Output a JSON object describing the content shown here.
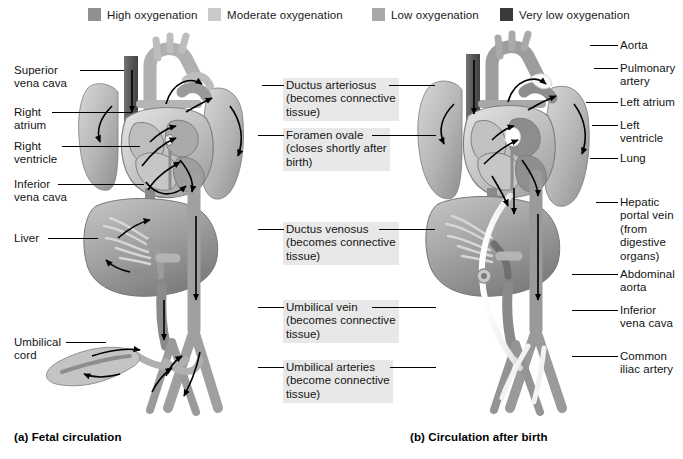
{
  "figure": {
    "width": 683,
    "height": 459
  },
  "legend": {
    "items": [
      {
        "label": "High oxygenation",
        "color": "#8f8f8f",
        "x": 88,
        "y": 0
      },
      {
        "label": "Moderate oxygenation",
        "color": "#c9c9c9",
        "x": 208,
        "y": 0
      },
      {
        "label": "Low oxygenation",
        "color": "#a8a8a8",
        "x": 372,
        "y": 0
      },
      {
        "label": "Very low oxygenation",
        "color": "#3a3a3a",
        "x": 500,
        "y": 0
      }
    ]
  },
  "panels": {
    "left": {
      "caption": "(a) Fetal circulation",
      "caption_x": 14,
      "caption_y": 437
    },
    "right": {
      "caption": "(b) Circulation after birth",
      "caption_x": 410,
      "caption_y": 437
    }
  },
  "labels_left": [
    {
      "text": "Superior\nvena cava",
      "x": 14,
      "y": 64,
      "line_x": 72,
      "line_y": 70,
      "line_w": 48
    },
    {
      "text": "Right\natrium",
      "x": 14,
      "y": 106,
      "line_x": 55,
      "line_y": 112,
      "line_w": 76
    },
    {
      "text": "Right\nventricle",
      "x": 14,
      "y": 140,
      "line_x": 68,
      "line_y": 146,
      "line_w": 78
    },
    {
      "text": "Inferior\nvena cava",
      "x": 14,
      "y": 178,
      "line_x": 62,
      "line_y": 184,
      "line_w": 80
    },
    {
      "text": "Liver",
      "x": 14,
      "y": 232,
      "line_x": 48,
      "line_y": 238,
      "line_w": 62
    },
    {
      "text": "Umbilical\ncord",
      "x": 14,
      "y": 336,
      "line_x": 68,
      "line_y": 342,
      "line_w": 46
    }
  ],
  "labels_center": [
    {
      "text": "Ductus arteriosus\n(becomes connective\ntissue)",
      "x": 283,
      "y": 78,
      "line_left_x": 265,
      "line_left_w": 18,
      "line_y": 85,
      "line_right_x": 389,
      "line_right_w": 46
    },
    {
      "text": "Foramen ovale\n(closes shortly after\nbirth)",
      "x": 283,
      "y": 128,
      "line_left_x": 262,
      "line_left_w": 21,
      "line_y": 135,
      "line_right_x": 374,
      "line_right_w": 62
    },
    {
      "text": "Ductus venosus\n(becomes connective\ntissue)",
      "x": 283,
      "y": 222,
      "line_left_x": 262,
      "line_left_w": 21,
      "line_y": 229,
      "line_right_x": 379,
      "line_right_w": 56
    },
    {
      "text": "Umbilical vein\n(becomes connective\ntissue)",
      "x": 283,
      "y": 300,
      "line_left_x": 262,
      "line_left_w": 21,
      "line_y": 307,
      "line_right_x": 373,
      "line_right_w": 62
    },
    {
      "text": "Umbilical arteries\n(become connective\ntissue)",
      "x": 283,
      "y": 360,
      "line_left_x": 262,
      "line_left_w": 21,
      "line_y": 367,
      "line_right_x": 390,
      "line_right_w": 46
    }
  ],
  "labels_right": [
    {
      "text": "Aorta",
      "x": 620,
      "y": 39,
      "line_x": 590,
      "line_y": 45,
      "line_w": 28
    },
    {
      "text": "Pulmonary\nartery",
      "x": 620,
      "y": 62,
      "line_x": 594,
      "line_y": 68,
      "line_w": 24
    },
    {
      "text": "Left atrium",
      "x": 620,
      "y": 96,
      "line_x": 586,
      "line_y": 102,
      "line_w": 32
    },
    {
      "text": "Left\nventricle",
      "x": 620,
      "y": 119,
      "line_x": 592,
      "line_y": 125,
      "line_w": 26
    },
    {
      "text": "Lung",
      "x": 620,
      "y": 152,
      "line_x": 590,
      "line_y": 158,
      "line_w": 28
    },
    {
      "text": "Hepatic\nportal vein\n(from\ndigestive\norgans)",
      "x": 620,
      "y": 196,
      "line_x": 596,
      "line_y": 202,
      "line_w": 22
    },
    {
      "text": "Abdominal\naorta",
      "x": 620,
      "y": 268,
      "line_x": 576,
      "line_y": 274,
      "line_w": 42
    },
    {
      "text": "Inferior\nvena cava",
      "x": 620,
      "y": 304,
      "line_x": 576,
      "line_y": 310,
      "line_w": 42
    },
    {
      "text": "Common\niliac artery",
      "x": 620,
      "y": 350,
      "line_x": 576,
      "line_y": 356,
      "line_w": 42
    }
  ],
  "anatomy": {
    "palette": {
      "high": "#8f8f8f",
      "moderate": "#c9c9c9",
      "low": "#a8a8a8",
      "verylow": "#3a3a3a",
      "outline": "#6b6b6b",
      "arrow": "#000000",
      "ligament": "#f2f2f2"
    },
    "left_structures": [
      "superior-vena-cava",
      "aortic-arch",
      "right-lung",
      "left-lung",
      "right-atrium",
      "right-ventricle",
      "left-atrium",
      "left-ventricle",
      "ductus-arteriosus",
      "foramen-ovale",
      "inferior-vena-cava",
      "liver",
      "ductus-venosus",
      "descending-aorta",
      "umbilical-vein",
      "umbilical-arteries",
      "umbilical-cord",
      "common-iliac-arteries"
    ],
    "right_structures": [
      "superior-vena-cava",
      "aortic-arch",
      "right-lung",
      "left-lung",
      "right-atrium",
      "right-ventricle",
      "left-atrium",
      "left-ventricle",
      "closed-ductus-arteriosus",
      "closed-foramen-ovale",
      "inferior-vena-cava",
      "liver",
      "hepatic-portal-vein",
      "abdominal-aorta",
      "round-ligament",
      "medial-umbilical-ligaments",
      "navel",
      "common-iliac-arteries"
    ]
  }
}
